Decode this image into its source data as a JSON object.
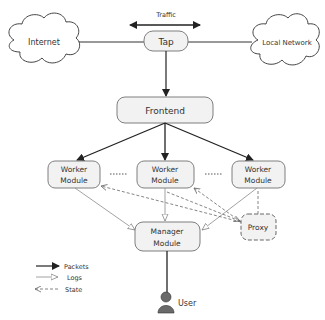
{
  "diagram": {
    "traffic_label": "Traffic",
    "nodes": {
      "internet": "Internet",
      "local_network": "Local Network",
      "tap": "Tap",
      "frontend": "Frontend",
      "worker_left": [
        "Worker",
        "Module"
      ],
      "worker_middle": [
        "Worker",
        "Module"
      ],
      "worker_right": [
        "Worker",
        "Module"
      ],
      "manager": [
        "Manager",
        "Module"
      ],
      "proxy": "Proxy",
      "user": "User"
    },
    "legend": [
      {
        "label": "Packets",
        "style": "solid-filled-arrow"
      },
      {
        "label": "Logs",
        "style": "thin-hollow-arrow"
      },
      {
        "label": "State",
        "style": "dashed-arrow"
      }
    ],
    "colors": {
      "box_fill": "#f2f2f2",
      "box_stroke": "#7f7f7f",
      "line": "#333333",
      "thin_line": "#8a8a8a",
      "user_icon": "#666666"
    }
  }
}
